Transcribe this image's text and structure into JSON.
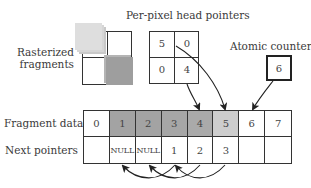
{
  "title": "Per-pixel head pointers",
  "labels": {
    "rasterized_line1": "Rasterized",
    "rasterized_line2": "fragments",
    "head_pointers": "Per-pixel head pointers",
    "atomic_counter": "Atomic counter",
    "fragment_data": "Fragment data",
    "next_pointers": "Next pointers"
  },
  "head_pointer_grid": [
    [
      "5",
      "0"
    ],
    [
      "0",
      "4"
    ]
  ],
  "atomic_counter_value": "6",
  "fragment_data": [
    "0",
    "1",
    "2",
    "3",
    "4",
    "5",
    "6",
    "7"
  ],
  "next_pointers": [
    "",
    "NULL",
    "NULL",
    "1",
    "2",
    "3",
    "",
    ""
  ],
  "fragment_fill_colors": [
    "#ffffff",
    "#a3a3a3",
    "#a3a3a3",
    "#a6a6a6",
    "#aaaaaa",
    "#cdcdcd",
    "#ffffff",
    "#ffffff"
  ],
  "colors": {
    "stroke": "#333333",
    "light_fragment": "#d0d0d0",
    "dark_fragment": "#9c9c9c"
  },
  "arrows": [
    {
      "from": "head-pointer cell (1,1) value 4",
      "to": "fragment 4"
    },
    {
      "from": "head-pointer cell (0,1) value 0",
      "to": "fragment 5"
    },
    {
      "from": "atomic counter",
      "to": "fragment 6"
    },
    {
      "from": "next pointer of fragment 5",
      "to": "fragment 3"
    },
    {
      "from": "next pointer of fragment 4",
      "to": "fragment 2"
    },
    {
      "from": "next pointer of fragment 3",
      "to": "fragment 1"
    }
  ]
}
